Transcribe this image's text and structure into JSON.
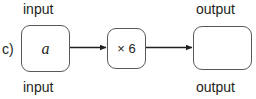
{
  "diagram": {
    "part_letter": "c)",
    "type": "function-machine",
    "labels": {
      "input_top": "input",
      "input_bottom": "input",
      "output_top": "output",
      "output_bottom": "output"
    },
    "nodes": [
      {
        "id": "input",
        "text": "a",
        "style": "italic-serif"
      },
      {
        "id": "operation",
        "text": "× 6",
        "style": "sans"
      },
      {
        "id": "output",
        "text": "",
        "style": "sans"
      }
    ],
    "arrows": [
      {
        "from": "input",
        "to": "operation"
      },
      {
        "from": "operation",
        "to": "output"
      }
    ],
    "colors": {
      "stroke": "#58595b",
      "text": "#231f20",
      "arrow": "#231f20",
      "background": "#ffffff"
    }
  }
}
